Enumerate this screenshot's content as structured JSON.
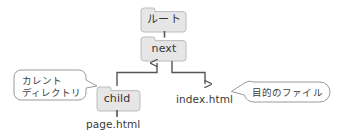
{
  "diagram": {
    "type": "directory-tree",
    "background_color": "#ffffff",
    "folder_fill": "#e6e6e6",
    "folder_stroke": "#b9b9b9",
    "callout_fill": "#ffffff",
    "callout_stroke": "#9a9a9a",
    "line_color": "#555555",
    "text_color": "#3a3a3a",
    "folders": [
      {
        "id": "root",
        "label": "ルート",
        "x": 139,
        "y": 9,
        "w": 47,
        "h": 22
      },
      {
        "id": "next",
        "label": "next",
        "x": 139,
        "y": 38,
        "w": 47,
        "h": 22
      },
      {
        "id": "child",
        "label": "child",
        "x": 95,
        "y": 88,
        "w": 45,
        "h": 22
      }
    ],
    "files": [
      {
        "id": "index-html",
        "label": "index.html",
        "x": 176,
        "y": 94
      },
      {
        "id": "page-html",
        "label": "page.html",
        "x": 86,
        "y": 119
      }
    ],
    "callouts": [
      {
        "id": "current-directory",
        "lines": [
          "カレント",
          "ディレクトリ"
        ],
        "x": 14,
        "y": 70,
        "w": 72,
        "h": 32,
        "pointer": "right"
      },
      {
        "id": "target-file",
        "lines": [
          "目的のファイル"
        ],
        "x": 245,
        "y": 82,
        "w": 86,
        "h": 22,
        "pointer": "left"
      }
    ],
    "connectors": [
      {
        "id": "root-to-next",
        "from": "root",
        "to": "next",
        "style": "plain-line"
      },
      {
        "id": "child-to-next",
        "from": "child",
        "to": "next",
        "style": "arrow-up"
      },
      {
        "id": "next-to-index",
        "from": "next",
        "to": "index-html",
        "style": "arrow-down"
      },
      {
        "id": "child-to-page",
        "from": "child",
        "to": "page-html",
        "style": "plain-line"
      }
    ]
  }
}
